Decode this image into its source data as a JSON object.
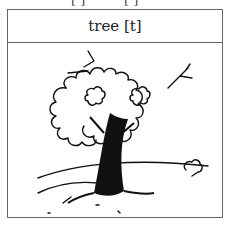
{
  "top_fragments": [
    "[ ]",
    "[ ]"
  ],
  "card": {
    "word": "tree",
    "phoneme": "[t]",
    "label": "tree [t]",
    "illustration": "tree-on-hill-illustration"
  }
}
